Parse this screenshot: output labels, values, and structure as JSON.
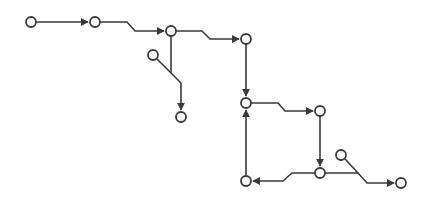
{
  "diagram": {
    "type": "flow-graph",
    "colors": {
      "stroke": "#3a3a3a",
      "node_fill": "#ffffff",
      "background": "#ffffff"
    },
    "node_radius": 5,
    "nodes": [
      {
        "id": "n1",
        "x": 31,
        "y": 22
      },
      {
        "id": "n2",
        "x": 95,
        "y": 22
      },
      {
        "id": "n3",
        "x": 171,
        "y": 31
      },
      {
        "id": "n3b",
        "x": 153,
        "y": 55
      },
      {
        "id": "n3c",
        "x": 181,
        "y": 117
      },
      {
        "id": "n4",
        "x": 246,
        "y": 39
      },
      {
        "id": "n5",
        "x": 246,
        "y": 103
      },
      {
        "id": "n6",
        "x": 320,
        "y": 111
      },
      {
        "id": "n7",
        "x": 320,
        "y": 173
      },
      {
        "id": "n7b",
        "x": 341,
        "y": 155
      },
      {
        "id": "n8",
        "x": 246,
        "y": 181
      },
      {
        "id": "n9",
        "x": 401,
        "y": 183
      }
    ],
    "edges": [
      {
        "from": "n1",
        "to": "n2",
        "arrow": true,
        "points": [
          [
            36,
            22
          ],
          [
            88,
            22
          ]
        ]
      },
      {
        "from": "n2",
        "to": "n3",
        "arrow": true,
        "points": [
          [
            100,
            22
          ],
          [
            127,
            22
          ],
          [
            135,
            31
          ],
          [
            164,
            31
          ]
        ]
      },
      {
        "from": "n3",
        "to": "n4",
        "arrow": true,
        "points": [
          [
            176,
            31
          ],
          [
            202,
            31
          ],
          [
            210,
            39
          ],
          [
            239,
            39
          ]
        ]
      },
      {
        "from": "n3",
        "to": "n3c",
        "arrow": true,
        "points": [
          [
            171,
            36
          ],
          [
            171,
            73
          ],
          [
            181,
            83
          ],
          [
            181,
            110
          ]
        ]
      },
      {
        "from": "n3b",
        "to": "n3c",
        "arrow": false,
        "points": [
          [
            157,
            59
          ],
          [
            171,
            73
          ]
        ]
      },
      {
        "from": "n4",
        "to": "n5",
        "arrow": true,
        "points": [
          [
            246,
            44
          ],
          [
            246,
            96
          ]
        ]
      },
      {
        "from": "n5",
        "to": "n6",
        "arrow": true,
        "points": [
          [
            251,
            103
          ],
          [
            278,
            103
          ],
          [
            285,
            111
          ],
          [
            313,
            111
          ]
        ]
      },
      {
        "from": "n6",
        "to": "n7",
        "arrow": true,
        "points": [
          [
            320,
            116
          ],
          [
            320,
            166
          ]
        ]
      },
      {
        "from": "n7",
        "to": "n8",
        "arrow": true,
        "points": [
          [
            315,
            173
          ],
          [
            292,
            173
          ],
          [
            283,
            181
          ],
          [
            253,
            181
          ]
        ]
      },
      {
        "from": "n8",
        "to": "n5",
        "arrow": true,
        "points": [
          [
            246,
            176
          ],
          [
            246,
            110
          ]
        ]
      },
      {
        "from": "n7",
        "to": "n9",
        "arrow": true,
        "points": [
          [
            325,
            173
          ],
          [
            358,
            173
          ],
          [
            367,
            183
          ],
          [
            394,
            183
          ]
        ]
      },
      {
        "from": "n7b",
        "to": "n9",
        "arrow": false,
        "points": [
          [
            345,
            159
          ],
          [
            358,
            173
          ]
        ]
      }
    ]
  }
}
